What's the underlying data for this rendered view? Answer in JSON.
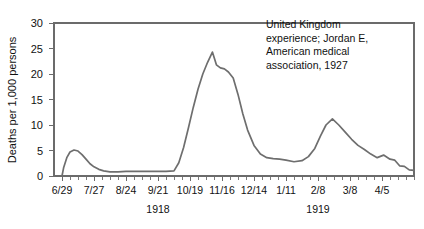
{
  "chart_data": {
    "type": "line",
    "title": "",
    "subtitle": "",
    "xlabel": "",
    "ylabel": "Deaths per 1,000 persons",
    "ylim": [
      0,
      30
    ],
    "yticks": [
      0,
      5,
      10,
      15,
      20,
      25,
      30
    ],
    "ytick_labels": [
      "0",
      "5",
      "10",
      "15",
      "20",
      "25",
      "30"
    ],
    "grid": false,
    "legend": "none",
    "xlim": [
      0,
      45
    ],
    "xtick_positions": [
      1,
      5,
      9,
      13,
      17,
      21,
      25,
      29,
      33,
      37,
      41
    ],
    "xtick_labels": [
      "6/29",
      "7/27",
      "8/24",
      "9/21",
      "10/19",
      "11/16",
      "12/14",
      "1/11",
      "2/8",
      "3/8",
      "4/5"
    ],
    "minor_tick_interval": 1,
    "period_labels": [
      {
        "label": "1918",
        "position": 13
      },
      {
        "label": "1919",
        "position": 33
      }
    ],
    "annotations": [
      {
        "name": "source-note",
        "lines": [
          "United Kingdom",
          "experience; Jordan E,",
          "American medical",
          "association, 1927"
        ],
        "x": 26.5,
        "y": 29
      }
    ],
    "series": [
      {
        "name": "weekly deaths per 1,000 persons",
        "x": [
          1.0,
          1.2,
          1.6,
          2.0,
          2.5,
          3.0,
          3.5,
          4.0,
          4.5,
          5.0,
          5.6,
          6.2,
          7.0,
          8.0,
          9.0,
          10.0,
          11.0,
          12.0,
          13.0,
          14.0,
          15.0,
          15.6,
          16.2,
          16.8,
          17.4,
          18.0,
          18.6,
          19.2,
          19.8,
          20.3,
          20.8,
          21.3,
          21.8,
          22.4,
          23.0,
          23.6,
          24.2,
          25.0,
          25.8,
          26.6,
          27.4,
          28.2,
          29.0,
          30.0,
          31.0,
          31.8,
          32.6,
          33.3,
          34.0,
          34.8,
          35.6,
          36.4,
          37.2,
          38.0,
          38.8,
          39.6,
          40.4,
          41.2,
          42.0,
          42.6,
          43.2,
          43.8,
          44.4,
          45.0
        ],
        "y": [
          0.0,
          1.6,
          3.6,
          4.7,
          5.1,
          4.9,
          4.2,
          3.3,
          2.4,
          1.8,
          1.3,
          1.0,
          0.8,
          0.8,
          0.9,
          0.9,
          0.9,
          0.9,
          0.9,
          0.9,
          1.0,
          2.6,
          5.6,
          9.4,
          13.4,
          17.0,
          20.0,
          22.3,
          24.3,
          21.8,
          21.2,
          21.0,
          20.4,
          19.2,
          16.0,
          12.2,
          9.0,
          6.0,
          4.3,
          3.6,
          3.4,
          3.3,
          3.1,
          2.8,
          3.0,
          3.8,
          5.4,
          7.8,
          10.0,
          11.2,
          10.0,
          8.6,
          7.2,
          6.0,
          5.2,
          4.3,
          3.6,
          4.1,
          3.3,
          3.1,
          2.0,
          1.9,
          1.2,
          1.1
        ]
      }
    ]
  }
}
